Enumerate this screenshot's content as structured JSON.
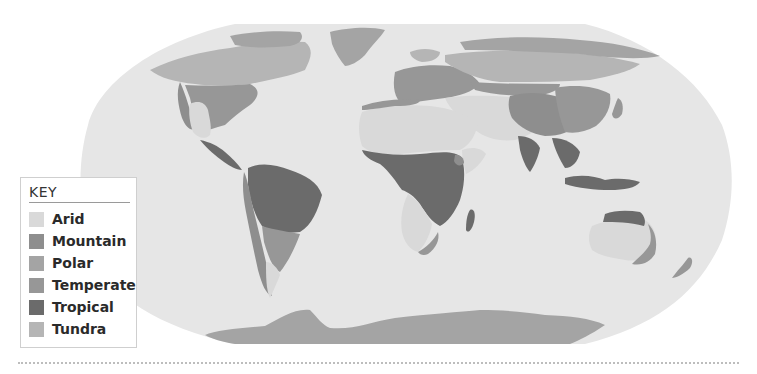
{
  "map": {
    "title": "World climate regions",
    "ocean_color": "#e6e6e6",
    "background": "#ffffff"
  },
  "legend": {
    "title": "KEY",
    "items": [
      {
        "label": "Arid",
        "color": "#d9d9d9"
      },
      {
        "label": "Mountain",
        "color": "#8e8e8e"
      },
      {
        "label": "Polar",
        "color": "#a4a4a4"
      },
      {
        "label": "Temperate",
        "color": "#979797"
      },
      {
        "label": "Tropical",
        "color": "#6b6b6b"
      },
      {
        "label": "Tundra",
        "color": "#b5b5b5"
      }
    ]
  }
}
